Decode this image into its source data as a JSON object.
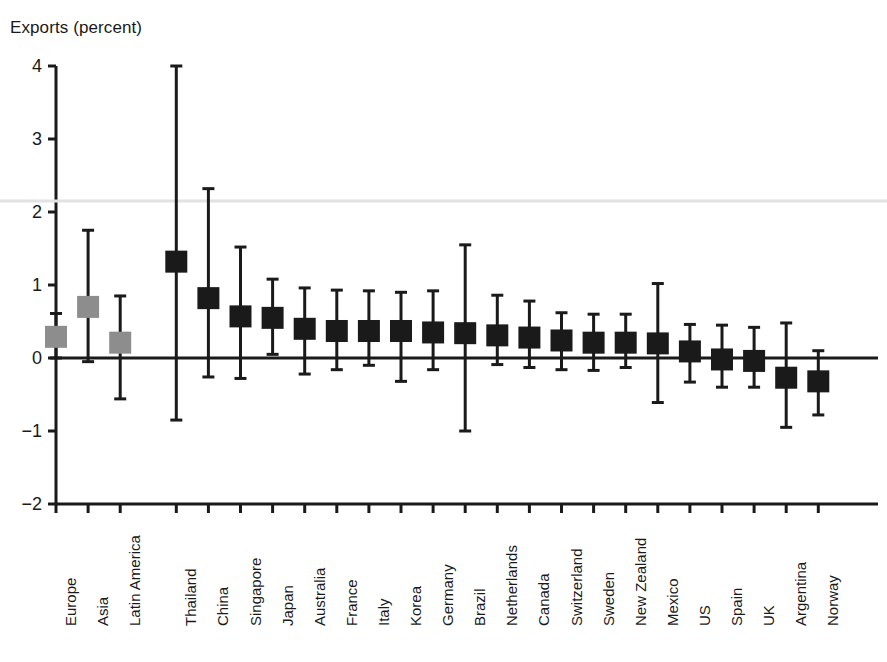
{
  "chart_data": {
    "type": "scatter",
    "title": "",
    "subtitle": "",
    "ylabel": "Exports (percent)",
    "xlabel": "",
    "ylim": [
      -2,
      4
    ],
    "yticks": [
      4,
      3,
      2,
      1,
      0,
      -1,
      -2
    ],
    "ytick_labels": [
      "4",
      "3",
      "2",
      "1",
      "0",
      "−1",
      "−2"
    ],
    "grid": false,
    "legend": "none",
    "marker_style": "square point estimate with vertical error bar (whisker caps)",
    "zero_line": true,
    "categories": [
      "Europe",
      "Asia",
      "Latin America",
      "Thailand",
      "China",
      "Singapore",
      "Japan",
      "Australia",
      "France",
      "Italy",
      "Korea",
      "Germany",
      "Brazil",
      "Netherlands",
      "Canada",
      "Switzerland",
      "Sweden",
      "New Zealand",
      "Mexico",
      "US",
      "Spain",
      "UK",
      "Argentina",
      "Norway"
    ],
    "series": [
      {
        "name": "Point estimate",
        "values": [
          0.29,
          0.7,
          0.21,
          1.32,
          0.82,
          0.57,
          0.55,
          0.4,
          0.37,
          0.37,
          0.37,
          0.35,
          0.34,
          0.31,
          0.28,
          0.24,
          0.21,
          0.21,
          0.2,
          0.09,
          -0.02,
          -0.04,
          -0.27,
          -0.32
        ]
      },
      {
        "name": "Upper bound",
        "values": [
          0.61,
          1.75,
          0.85,
          4.0,
          2.32,
          1.52,
          1.08,
          0.96,
          0.93,
          0.92,
          0.9,
          0.92,
          1.55,
          0.86,
          0.78,
          0.62,
          0.6,
          0.6,
          1.02,
          0.46,
          0.45,
          0.42,
          0.48,
          0.1
        ]
      },
      {
        "name": "Lower bound",
        "values": [
          0.0,
          -0.05,
          -0.56,
          -0.85,
          -0.26,
          -0.28,
          0.05,
          -0.22,
          -0.16,
          -0.1,
          -0.32,
          -0.16,
          -1.0,
          -0.09,
          -0.13,
          -0.16,
          -0.17,
          -0.13,
          -0.61,
          -0.33,
          -0.4,
          -0.4,
          -0.95,
          -0.78
        ]
      }
    ],
    "marker_colors": [
      "#8d8d8d",
      "#8d8d8d",
      "#8d8d8d",
      "#1a1a1a",
      "#1a1a1a",
      "#1a1a1a",
      "#1a1a1a",
      "#1a1a1a",
      "#1a1a1a",
      "#1a1a1a",
      "#1a1a1a",
      "#1a1a1a",
      "#1a1a1a",
      "#1a1a1a",
      "#1a1a1a",
      "#1a1a1a",
      "#1a1a1a",
      "#1a1a1a",
      "#1a1a1a",
      "#1a1a1a",
      "#1a1a1a",
      "#1a1a1a",
      "#1a1a1a",
      "#1a1a1a"
    ],
    "colors": {
      "aggregate_marker": "#8d8d8d",
      "country_marker": "#1a1a1a",
      "axis": "#1a1a1a",
      "background": "#ffffff"
    },
    "annotations": [
      "First three entries (Europe, Asia, Latin America) are regional aggregates shown in gray",
      "Gap between Latin America and Thailand separates aggregates from individual countries"
    ]
  }
}
